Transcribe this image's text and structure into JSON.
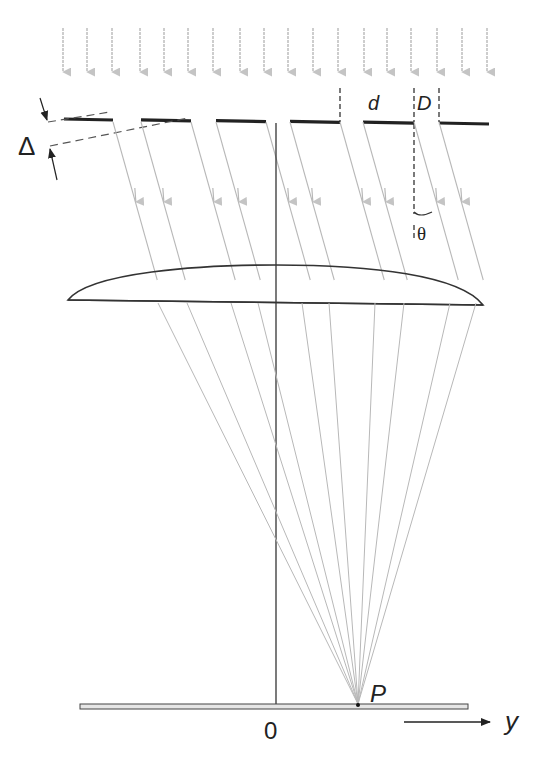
{
  "figure": {
    "labels": {
      "slit_period": "d",
      "slit_width": "D",
      "angle": "θ",
      "path_difference": "Δ",
      "focal_point": "P",
      "origin": "0",
      "axis": "y"
    },
    "colors": {
      "ray": "#b8b8b8",
      "grating": "#222222",
      "lens": "#333333",
      "axis": "#333333",
      "screen_fill": "#e6e6e6"
    },
    "incident_arrows_x": [
      63,
      87,
      112,
      140,
      164,
      188,
      213,
      240,
      264,
      288,
      313,
      338,
      364,
      387,
      411,
      437,
      462,
      487
    ],
    "grating_segments": [
      [
        64,
        113
      ],
      [
        141,
        191
      ],
      [
        216,
        266
      ],
      [
        290,
        340
      ],
      [
        363,
        414
      ],
      [
        439,
        489
      ]
    ],
    "diffracted_ray_origins_x": [
      113,
      141,
      191,
      216,
      266,
      290,
      340,
      363,
      414,
      439
    ],
    "lens_exit_x": [
      158,
      187,
      231,
      258,
      302,
      329,
      375,
      404,
      450,
      476
    ],
    "focal_point": [
      358,
      704
    ]
  }
}
